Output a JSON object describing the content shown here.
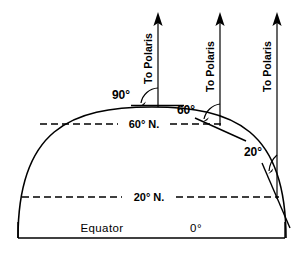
{
  "figure": {
    "background_color": "#ffffff",
    "line_color": "#000000",
    "width": 304,
    "height": 260
  },
  "polaris_arrows": [
    {
      "id": "polaris-90",
      "label": "To Polaris",
      "angle_label": "90°",
      "latitude": "90° N.",
      "x": 158,
      "tip_y": 13,
      "base_y": 107
    },
    {
      "id": "polaris-60",
      "label": "To Polaris",
      "angle_label": "60°",
      "latitude": "60° N.",
      "x": 220,
      "tip_y": 13,
      "base_y": 124
    },
    {
      "id": "polaris-20",
      "label": "To Polaris",
      "angle_label": "20°",
      "latitude": "20° N.",
      "x": 277,
      "tip_y": 13,
      "base_y": 197
    }
  ],
  "latitude_lines": [
    {
      "id": "lat-60",
      "label": "60° N.",
      "y": 124,
      "x1": 40,
      "x2": 222
    },
    {
      "id": "lat-20",
      "label": "20° N.",
      "y": 197,
      "x1": 22,
      "x2": 278
    }
  ],
  "baseline": {
    "equator_label": "Equator",
    "degree_label": "0°",
    "y": 238,
    "x1": 18,
    "x2": 285
  },
  "angle_marks": [
    {
      "id": "angle-90",
      "label": "90°",
      "x": 122,
      "y": 95
    },
    {
      "id": "angle-60",
      "label": "60°",
      "x": 186,
      "y": 110
    },
    {
      "id": "angle-20",
      "label": "20°",
      "x": 253,
      "y": 152
    }
  ],
  "icons": {
    "arrowhead": "arrow-up-icon"
  }
}
